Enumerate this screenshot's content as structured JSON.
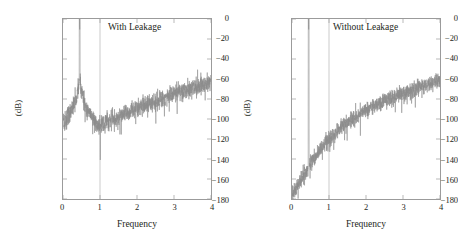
{
  "figure": {
    "background_color": "#ffffff",
    "data_color": "#8c8c8c",
    "axis_color": "#9b9b9b",
    "text_color": "#231f20"
  },
  "chart_data": [
    {
      "type": "line",
      "title": "With Leakage",
      "xlabel": "Frequency",
      "ylabel": "(dB)",
      "xlim": [
        0,
        4
      ],
      "ylim": [
        -180,
        0
      ],
      "xticks": [
        0,
        1,
        2,
        3,
        4
      ],
      "xtick_labels": [
        "0",
        "1",
        "2",
        "3",
        "4"
      ],
      "yticks": [
        0,
        -20,
        -40,
        -60,
        -80,
        -100,
        -120,
        -140,
        -160,
        -180
      ],
      "ytick_labels": [
        "0",
        "−20",
        "−40",
        "−60",
        "−80",
        "−100",
        "−120",
        "−140",
        "−160",
        "−180"
      ],
      "grid": "vertical-line-at-x-1",
      "legend": "none",
      "annotations": [
        {
          "text": "With Leakage",
          "x": 1.85,
          "y": -12
        }
      ],
      "signal_peak": {
        "x": 0.45,
        "y": -13
      },
      "noise_floor_envelope": {
        "x": [
          0.0,
          0.1,
          0.25,
          0.45,
          0.7,
          1.0,
          1.4,
          1.8,
          2.2,
          2.6,
          3.0,
          3.4,
          3.7,
          4.0
        ],
        "y": [
          -158,
          -146,
          -132,
          -122,
          -114,
          -106,
          -99,
          -93,
          -87,
          -81,
          -75,
          -70,
          -66,
          -63
        ],
        "spread_db": 18
      },
      "description": "Periodogram noise floor rises approximately linearly from -158 dB at f=0 to -63 dB at f=4; single spectral spike at f=0.45 reaching -13 dB; broad leakage skirt around the spike."
    },
    {
      "type": "line",
      "title": "Without Leakage",
      "xlabel": "Frequency",
      "ylabel": "(dB)",
      "xlim": [
        0,
        4
      ],
      "ylim": [
        -180,
        0
      ],
      "xticks": [
        0,
        1,
        2,
        3,
        4
      ],
      "xtick_labels": [
        "0",
        "1",
        "2",
        "3",
        "4"
      ],
      "yticks": [
        0,
        -20,
        -40,
        -60,
        -80,
        -100,
        -120,
        -140,
        -160,
        -180
      ],
      "ytick_labels": [
        "0",
        "−20",
        "−40",
        "−60",
        "−80",
        "−100",
        "−120",
        "−140",
        "−160",
        "−180"
      ],
      "grid": "vertical-line-at-x-1",
      "legend": "none",
      "annotations": [
        {
          "text": "Without Leakage",
          "x": 2.0,
          "y": -12
        }
      ],
      "signal_peak": {
        "x": 0.45,
        "y": -13
      },
      "noise_floor_envelope": {
        "x": [
          0.0,
          0.1,
          0.25,
          0.45,
          0.7,
          1.0,
          1.4,
          1.8,
          2.2,
          2.6,
          3.0,
          3.4,
          3.7,
          4.0
        ],
        "y": [
          -176,
          -170,
          -160,
          -148,
          -134,
          -120,
          -106,
          -95,
          -87,
          -80,
          -74,
          -69,
          -65,
          -61
        ],
        "spread_db": 16
      },
      "description": "Periodogram noise floor starts near -176 dB at f=0, climbs steeply and curves over, approaching -61 dB at f=4; single spectral spike at f=0.45 reaching -13 dB with no leakage skirt."
    }
  ],
  "panels": [
    {
      "id": "with-leakage",
      "caption": "With Leakage",
      "xlabel": "Frequency",
      "ylabel": "(dB)",
      "xtick_labels": [
        "0",
        "1",
        "2",
        "3",
        "4"
      ],
      "ytick_labels": [
        "0",
        "−20",
        "−40",
        "−60",
        "−80",
        "−100",
        "−120",
        "−140",
        "−160",
        "−180"
      ]
    },
    {
      "id": "without-leakage",
      "caption": "Without Leakage",
      "xlabel": "Frequency",
      "ylabel": "(dB)",
      "xtick_labels": [
        "0",
        "1",
        "2",
        "3",
        "4"
      ],
      "ytick_labels": [
        "0",
        "−20",
        "−40",
        "−60",
        "−80",
        "−100",
        "−120",
        "−140",
        "−160",
        "−180"
      ]
    }
  ]
}
